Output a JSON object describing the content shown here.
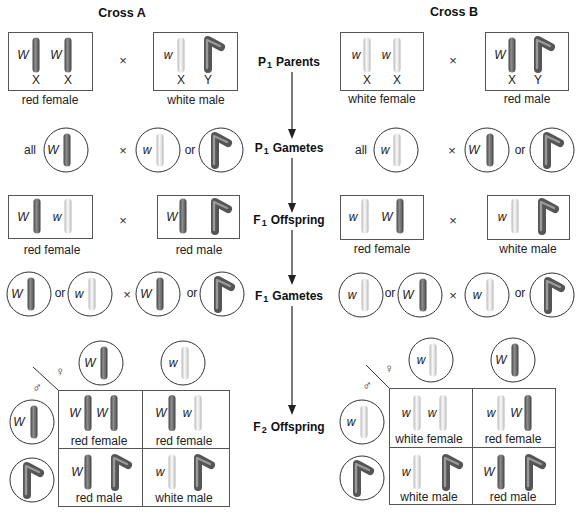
{
  "center": {
    "steps": [
      {
        "gen": "P",
        "sub": "1",
        "name": "Parents"
      },
      {
        "gen": "P",
        "sub": "1",
        "name": "Gametes"
      },
      {
        "gen": "F",
        "sub": "1",
        "name": "Offspring"
      },
      {
        "gen": "F",
        "sub": "1",
        "name": "Gametes"
      },
      {
        "gen": "F",
        "sub": "2",
        "name": "Offspring"
      }
    ]
  },
  "colors": {
    "red_allele_chromosome": "#6e6e6e",
    "white_allele_chromosome": "#ececec",
    "y_chromosome": "#5f5f5f"
  },
  "crossA": {
    "title": "Cross A",
    "p1_parents": {
      "female": {
        "phenotype": "red female",
        "chromosomes": [
          {
            "allele": "W",
            "chrom": "X"
          },
          {
            "allele": "W",
            "chrom": "X"
          }
        ]
      },
      "cross_symbol": "×",
      "male": {
        "phenotype": "white male",
        "chromosomes": [
          {
            "allele": "w",
            "chrom": "X"
          },
          {
            "allele": null,
            "chrom": "Y"
          }
        ]
      }
    },
    "p1_gametes": {
      "female": {
        "prefix": "all",
        "gametes": [
          {
            "allele": "W",
            "chrom": "X"
          }
        ]
      },
      "cross_symbol": "×",
      "male": {
        "gametes": [
          {
            "allele": "w",
            "chrom": "X"
          },
          {
            "allele": null,
            "chrom": "Y"
          }
        ],
        "joiner": "or"
      }
    },
    "f1_offspring": {
      "female": {
        "phenotype": "red female",
        "chromosomes": [
          {
            "allele": "W",
            "chrom": "X"
          },
          {
            "allele": "w",
            "chrom": "X"
          }
        ]
      },
      "cross_symbol": "×",
      "male": {
        "phenotype": "red male",
        "chromosomes": [
          {
            "allele": "W",
            "chrom": "X"
          },
          {
            "allele": null,
            "chrom": "Y"
          }
        ]
      }
    },
    "f1_gametes": {
      "female": {
        "gametes": [
          {
            "allele": "W",
            "chrom": "X"
          },
          {
            "allele": "w",
            "chrom": "X"
          }
        ],
        "joiner": "or"
      },
      "cross_symbol": "×",
      "male": {
        "gametes": [
          {
            "allele": "W",
            "chrom": "X"
          },
          {
            "allele": null,
            "chrom": "Y"
          }
        ],
        "joiner": "or"
      }
    },
    "f2_punnett": {
      "female_symbol": "♀",
      "male_symbol": "♂",
      "female_gametes": [
        {
          "allele": "W",
          "chrom": "X"
        },
        {
          "allele": "w",
          "chrom": "X"
        }
      ],
      "male_gametes": [
        {
          "allele": "W",
          "chrom": "X"
        },
        {
          "allele": null,
          "chrom": "Y"
        }
      ],
      "rows": [
        [
          {
            "phenotype": "red female",
            "chromosomes": [
              {
                "allele": "W",
                "chrom": "X"
              },
              {
                "allele": "W",
                "chrom": "X"
              }
            ]
          },
          {
            "phenotype": "red female",
            "chromosomes": [
              {
                "allele": "W",
                "chrom": "X"
              },
              {
                "allele": "w",
                "chrom": "X"
              }
            ]
          }
        ],
        [
          {
            "phenotype": "red male",
            "chromosomes": [
              {
                "allele": "W",
                "chrom": "X"
              },
              {
                "allele": null,
                "chrom": "Y"
              }
            ]
          },
          {
            "phenotype": "white male",
            "chromosomes": [
              {
                "allele": "w",
                "chrom": "X"
              },
              {
                "allele": null,
                "chrom": "Y"
              }
            ]
          }
        ]
      ]
    }
  },
  "crossB": {
    "title": "Cross B",
    "p1_parents": {
      "female": {
        "phenotype": "white female",
        "chromosomes": [
          {
            "allele": "w",
            "chrom": "X"
          },
          {
            "allele": "w",
            "chrom": "X"
          }
        ]
      },
      "cross_symbol": "×",
      "male": {
        "phenotype": "red male",
        "chromosomes": [
          {
            "allele": "W",
            "chrom": "X"
          },
          {
            "allele": null,
            "chrom": "Y"
          }
        ]
      }
    },
    "p1_gametes": {
      "female": {
        "prefix": "all",
        "gametes": [
          {
            "allele": "w",
            "chrom": "X"
          }
        ]
      },
      "cross_symbol": "×",
      "male": {
        "gametes": [
          {
            "allele": "W",
            "chrom": "X"
          },
          {
            "allele": null,
            "chrom": "Y"
          }
        ],
        "joiner": "or"
      }
    },
    "f1_offspring": {
      "female": {
        "phenotype": "red female",
        "chromosomes": [
          {
            "allele": "w",
            "chrom": "X"
          },
          {
            "allele": "W",
            "chrom": "X"
          }
        ]
      },
      "cross_symbol": "×",
      "male": {
        "phenotype": "white male",
        "chromosomes": [
          {
            "allele": "w",
            "chrom": "X"
          },
          {
            "allele": null,
            "chrom": "Y"
          }
        ]
      }
    },
    "f1_gametes": {
      "female": {
        "gametes": [
          {
            "allele": "w",
            "chrom": "X"
          },
          {
            "allele": "W",
            "chrom": "X"
          }
        ],
        "joiner": "or"
      },
      "cross_symbol": "×",
      "male": {
        "gametes": [
          {
            "allele": "w",
            "chrom": "X"
          },
          {
            "allele": null,
            "chrom": "Y"
          }
        ],
        "joiner": "or"
      }
    },
    "f2_punnett": {
      "female_symbol": "♀",
      "male_symbol": "♂",
      "female_gametes": [
        {
          "allele": "w",
          "chrom": "X"
        },
        {
          "allele": "W",
          "chrom": "X"
        }
      ],
      "male_gametes": [
        {
          "allele": "w",
          "chrom": "X"
        },
        {
          "allele": null,
          "chrom": "Y"
        }
      ],
      "rows": [
        [
          {
            "phenotype": "white female",
            "chromosomes": [
              {
                "allele": "w",
                "chrom": "X"
              },
              {
                "allele": "w",
                "chrom": "X"
              }
            ]
          },
          {
            "phenotype": "red female",
            "chromosomes": [
              {
                "allele": "w",
                "chrom": "X"
              },
              {
                "allele": "W",
                "chrom": "X"
              }
            ]
          }
        ],
        [
          {
            "phenotype": "white male",
            "chromosomes": [
              {
                "allele": "w",
                "chrom": "X"
              },
              {
                "allele": null,
                "chrom": "Y"
              }
            ]
          },
          {
            "phenotype": "red male",
            "chromosomes": [
              {
                "allele": "W",
                "chrom": "X"
              },
              {
                "allele": null,
                "chrom": "Y"
              }
            ]
          }
        ]
      ]
    }
  }
}
